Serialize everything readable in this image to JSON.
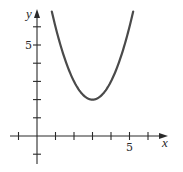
{
  "chart_data": {
    "type": "line",
    "title": "",
    "xlabel": "x",
    "ylabel": "y",
    "function": "y = (x - 3)^2 + 2",
    "vertex": [
      3,
      2
    ],
    "domain": [
      0.8,
      5.2
    ],
    "xlim": [
      -1.5,
      6.9
    ],
    "ylim": [
      -1.5,
      6.9
    ],
    "x_ticks": [
      -1,
      1,
      2,
      3,
      4,
      5,
      6
    ],
    "y_ticks": [
      -1,
      1,
      2,
      3,
      4,
      5,
      6
    ],
    "x_tick_labels": [
      {
        "value": 5,
        "label": "5"
      }
    ],
    "y_tick_labels": [
      {
        "value": 5,
        "label": "5"
      }
    ],
    "grid": false,
    "legend": null,
    "series": [
      {
        "name": "parabola",
        "x": [
          0.8,
          1.0,
          1.5,
          2.0,
          2.5,
          3.0,
          3.5,
          4.0,
          4.5,
          5.0,
          5.2
        ],
        "y": [
          6.84,
          6.0,
          4.25,
          3.0,
          2.25,
          2.0,
          2.25,
          3.0,
          4.25,
          6.0,
          6.84
        ]
      }
    ]
  },
  "layout": {
    "origin_px": [
      37,
      136
    ],
    "unit_x_px": 18.5,
    "unit_y_px": 18.2,
    "x_axis_px": [
      10,
      168
    ],
    "y_axis_px": [
      164,
      9
    ]
  }
}
